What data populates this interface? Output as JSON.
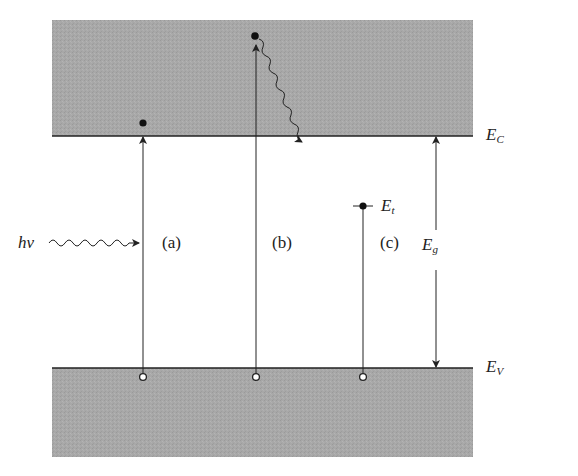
{
  "diagram": {
    "type": "energy-band-diagram",
    "colors": {
      "band_fill": "#a9a9a9",
      "line": "#222222",
      "background": "#ffffff"
    },
    "bands": {
      "conduction": {
        "label_main": "E",
        "label_sub": "C"
      },
      "valence": {
        "label_main": "E",
        "label_sub": "V"
      }
    },
    "trap_level": {
      "label_main": "E",
      "label_sub": "t"
    },
    "band_gap": {
      "label_main": "E",
      "label_sub": "g"
    },
    "photon": {
      "label": "hν"
    },
    "transitions": [
      {
        "id": "a",
        "label": "(a)"
      },
      {
        "id": "b",
        "label": "(b)"
      },
      {
        "id": "c",
        "label": "(c)"
      }
    ]
  }
}
